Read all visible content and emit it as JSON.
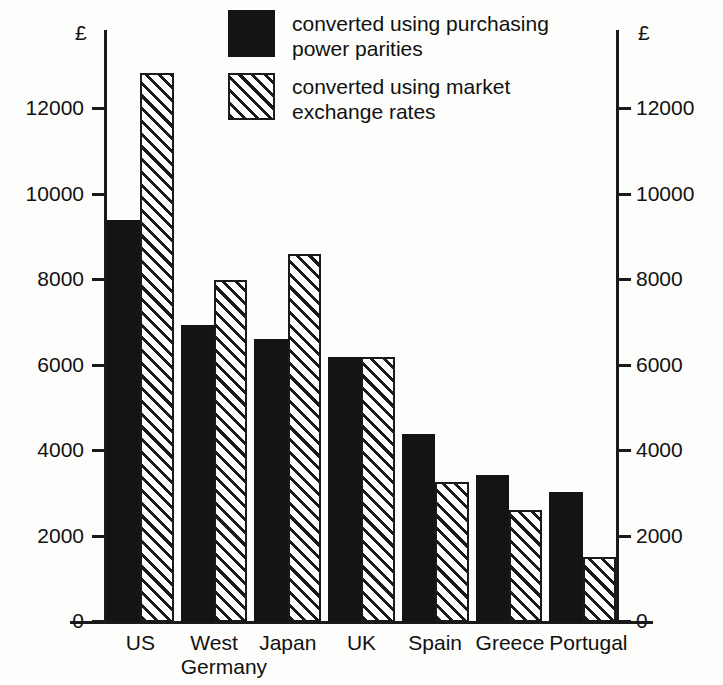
{
  "chart_data": {
    "type": "bar",
    "title": "",
    "xlabel": "",
    "ylabel": "£",
    "y_unit_left": "£",
    "y_unit_right": "£",
    "ylim": [
      0,
      13500
    ],
    "yticks": [
      0,
      2000,
      4000,
      6000,
      8000,
      10000,
      12000
    ],
    "ytick_labels": [
      "0",
      "2000",
      "4000",
      "6000",
      "8000",
      "10000",
      "12000"
    ],
    "grid": false,
    "dual_axis": true,
    "legend_position": "top-center",
    "categories": [
      "US",
      "West\nGermany",
      "Japan",
      "UK",
      "Spain",
      "Greece",
      "Portugal"
    ],
    "series": [
      {
        "name": "converted using purchasing power parities",
        "fill": "solid-black",
        "values": [
          9400,
          6950,
          6630,
          6200,
          4400,
          3430,
          3030
        ]
      },
      {
        "name": "converted using market exchange rates",
        "fill": "diagonal-hatch",
        "values": [
          12850,
          8000,
          8600,
          6200,
          3280,
          2620,
          1520
        ]
      }
    ]
  },
  "legend": {
    "items": [
      {
        "label": "converted using purchasing\npower parities",
        "swatch": "solid-black"
      },
      {
        "label": "converted using market\nexchange rates",
        "swatch": "diagonal-hatch"
      }
    ]
  },
  "colors": {
    "solid_series": "#141414",
    "hatch_line": "#1a1a1a",
    "hatch_background": "#ffffff",
    "axis": "#1a1a1a",
    "background": "#fdfdfb"
  }
}
